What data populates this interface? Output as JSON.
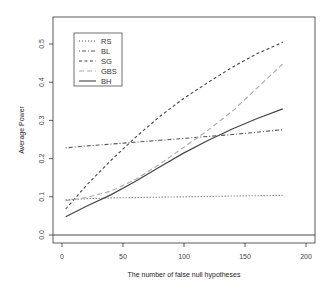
{
  "chart_data": {
    "type": "line",
    "title": "",
    "xlabel": "The number of false null hypotheses",
    "ylabel": "Average Power",
    "xlim": [
      -5,
      210
    ],
    "ylim": [
      -0.01,
      0.56
    ],
    "xticks": [
      0,
      50,
      100,
      150,
      200
    ],
    "xtick_labels": [
      "0",
      "50",
      "100",
      "150",
      "200"
    ],
    "yticks": [
      0.0,
      0.1,
      0.2,
      0.3,
      0.4,
      0.5
    ],
    "ytick_labels": [
      "0.0",
      "0.1",
      "0.2",
      "0.3",
      "0.4",
      "0.5"
    ],
    "grid": false,
    "legend_position": "top-left",
    "hline": 0.0,
    "x": [
      3,
      20,
      40,
      60,
      80,
      100,
      120,
      140,
      160,
      181
    ],
    "series": [
      {
        "name": "RS",
        "style": "dotted",
        "color": "#555555",
        "values": [
          0.092,
          0.095,
          0.097,
          0.098,
          0.099,
          0.1,
          0.101,
          0.102,
          0.103,
          0.104
        ]
      },
      {
        "name": "BL",
        "style": "dotdash",
        "color": "#555555",
        "values": [
          0.228,
          0.233,
          0.238,
          0.243,
          0.248,
          0.253,
          0.258,
          0.263,
          0.269,
          0.276
        ]
      },
      {
        "name": "SG",
        "style": "dashed",
        "color": "#444444",
        "values": [
          0.068,
          0.13,
          0.195,
          0.255,
          0.31,
          0.358,
          0.4,
          0.44,
          0.475,
          0.505
        ]
      },
      {
        "name": "GBS",
        "style": "longdash",
        "color": "#aaaaaa",
        "values": [
          0.09,
          0.098,
          0.115,
          0.145,
          0.185,
          0.23,
          0.275,
          0.325,
          0.385,
          0.448
        ]
      },
      {
        "name": "BH",
        "style": "solid",
        "color": "#444444",
        "values": [
          0.048,
          0.075,
          0.105,
          0.14,
          0.178,
          0.215,
          0.248,
          0.278,
          0.305,
          0.33
        ]
      }
    ]
  }
}
